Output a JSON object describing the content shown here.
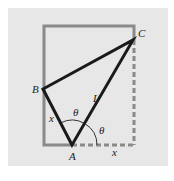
{
  "figure": {
    "background_color": "#e7e7e7",
    "frame_color": "#888888",
    "line_color": "#1a1a1a",
    "points": {
      "A": {
        "label": "A",
        "x": 72,
        "y": 145
      },
      "B": {
        "label": "B",
        "x": 43,
        "y": 89
      },
      "C": {
        "label": "C",
        "x": 133,
        "y": 40
      }
    },
    "segments": {
      "AB": {
        "label": "x"
      },
      "AC": {
        "label": "L"
      },
      "bottom_dashed": {
        "label": "x"
      }
    },
    "angles": {
      "angle_BAC": {
        "label": "θ"
      },
      "angle_CA_ground": {
        "label": "θ"
      }
    }
  }
}
